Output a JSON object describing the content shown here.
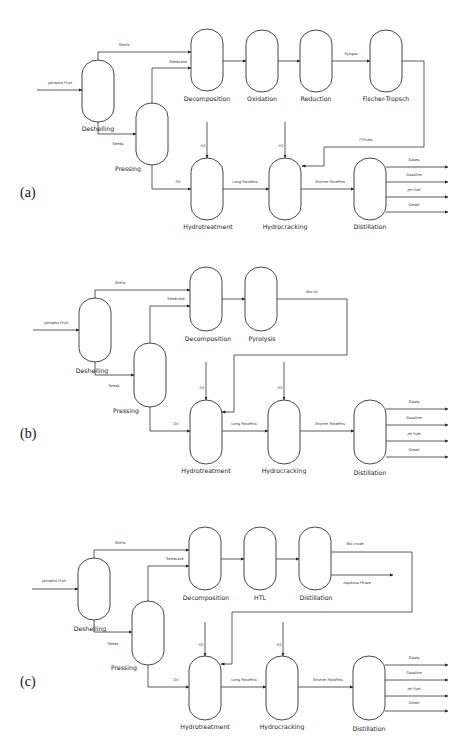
{
  "diagram_title": "Jatropha fruit to jet fuel process flow diagrams",
  "colors": {
    "stroke": "#333333",
    "text": "#222222",
    "background": "#ffffff"
  },
  "panels": [
    {
      "id": "a",
      "label": "(a)",
      "feed": "Jatropha Fruit",
      "units": {
        "deshelling": "Deshelling",
        "pressing": "Pressing",
        "decomposition": "Decomposition",
        "oxidation": "Oxidation",
        "reduction": "Reduction",
        "fischer_tropsch": "Fischer-Tropsch",
        "hydrotreatment": "Hydrotreatment",
        "hydrocracking": "Hydrocracking",
        "distillation": "Distillation"
      },
      "streams": {
        "shells": "Shells",
        "seeds": "Seeds",
        "seedcake": "Seedcake",
        "syngas": "Syngas",
        "ft_fuels": "FTFuels",
        "oil": "Oil",
        "h2_1": "H2",
        "h2_2": "H2",
        "long_paraffins": "Long Paraffins",
        "shorter_paraffins": "Shorter Paraffins"
      },
      "products": [
        "Gases",
        "Gasoline",
        "Jet Fuel",
        "Diesel"
      ]
    },
    {
      "id": "b",
      "label": "(b)",
      "feed": "Jatropha Fruit",
      "units": {
        "deshelling": "Deshelling",
        "pressing": "Pressing",
        "decomposition": "Decomposition",
        "pyrolysis": "Pyrolysis",
        "hydrotreatment": "Hydrotreatment",
        "hydrocracking": "Hydrocracking",
        "distillation": "Distillation"
      },
      "streams": {
        "shells": "Shells",
        "seeds": "Seeds",
        "seedcake": "Seedcake",
        "bio_oil": "Bio-oil",
        "oil": "Oil",
        "h2_1": "H2",
        "h2_2": "H2",
        "long_paraffins": "Long Paraffins",
        "shorter_paraffins": "Shorter Paraffins"
      },
      "products": [
        "Gases",
        "Gasoline",
        "Jet Fuel",
        "Diesel"
      ]
    },
    {
      "id": "c",
      "label": "(c)",
      "feed": "Jatropha Fruit",
      "units": {
        "deshelling": "Deshelling",
        "pressing": "Pressing",
        "decomposition": "Decomposition",
        "htl": "HTL",
        "distillation_1": "Distillation",
        "hydrotreatment": "Hydrotreatment",
        "hydrocracking": "Hydrocracking",
        "distillation": "Distillation"
      },
      "streams": {
        "shells": "Shells",
        "seeds": "Seeds",
        "seedcake": "Seedcake",
        "bio_crude": "Bio-crude",
        "aqueous_phase": "Aqueous Phase",
        "oil": "Oil",
        "h2_1": "H2",
        "h2_2": "H2",
        "long_paraffins": "Long Paraffins",
        "shorter_paraffins": "Shorter Paraffins"
      },
      "products": [
        "Gases",
        "Gasoline",
        "Jet Fuel",
        "Diesel"
      ]
    }
  ]
}
